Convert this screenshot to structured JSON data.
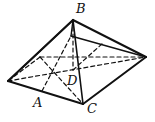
{
  "diagram": {
    "type": "square pyramid",
    "labels": {
      "B": "B",
      "D": "D",
      "A": "A",
      "C": "C"
    },
    "colors": {
      "stroke": "#111111",
      "background": "#ffffff"
    },
    "points": {
      "apex_B": [
        73,
        20
      ],
      "inner_top": [
        71,
        36
      ],
      "left": [
        8,
        81
      ],
      "front_C": [
        83,
        104
      ],
      "right": [
        146,
        57
      ],
      "back": [
        40,
        57
      ],
      "center_D": [
        73,
        70
      ],
      "mid_A": [
        42,
        91
      ]
    }
  }
}
